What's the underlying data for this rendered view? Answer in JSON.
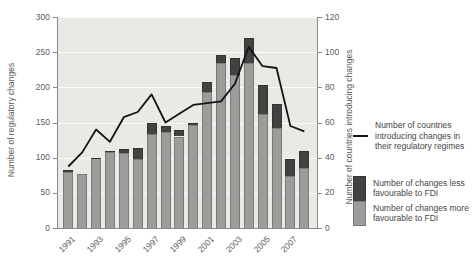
{
  "chart_data": {
    "type": "bar",
    "subtype": "stacked-bars-with-line-overlay",
    "title": "",
    "categories": [
      "1991",
      "1992",
      "1993",
      "1994",
      "1995",
      "1996",
      "1997",
      "1998",
      "1999",
      "2000",
      "2001",
      "2002",
      "2003",
      "2004",
      "2005",
      "2006",
      "2007",
      "2008"
    ],
    "x_axis": {
      "labeled_years": [
        "1991",
        "1993",
        "1995",
        "1997",
        "1999",
        "2001",
        "2003",
        "2005",
        "2007"
      ]
    },
    "left_axis": {
      "label": "Number of regulatory changes",
      "min": 0,
      "max": 300,
      "step": 50
    },
    "right_axis": {
      "label": "Number of countries introducing changes",
      "min": 0,
      "max": 120,
      "step": 20
    },
    "grid": "horizontal-white-lines",
    "legend_position": "right",
    "series": [
      {
        "name": "Number of changes more favourable to FDI",
        "type": "bar-segment",
        "axis": "left",
        "color": "#9c9c9a",
        "values": [
          80,
          77,
          99,
          108,
          106,
          98,
          134,
          136,
          130,
          147,
          193,
          234,
          218,
          234,
          162,
          142,
          74,
          85
        ]
      },
      {
        "name": "Number of changes less favourable to FDI",
        "type": "bar-segment",
        "axis": "left",
        "color": "#424240",
        "values": [
          2,
          0,
          1,
          2,
          6,
          16,
          16,
          9,
          9,
          3,
          14,
          12,
          24,
          36,
          41,
          35,
          24,
          25
        ]
      },
      {
        "name": "Number of countries introducing changes in their regulatory regimes",
        "type": "line",
        "axis": "right",
        "color": "#141414",
        "values": [
          35,
          43,
          56,
          49,
          63,
          66,
          76,
          60,
          65,
          70,
          71,
          72,
          82,
          103,
          92,
          91,
          58,
          55
        ]
      }
    ]
  },
  "colors": {
    "plot_background": "#e9e9e5",
    "bar_favourable": "#9c9c9a",
    "bar_less_favourable": "#424240",
    "line": "#141414",
    "axis": "#8a8a88",
    "tick_text": "#5c5c5a"
  }
}
